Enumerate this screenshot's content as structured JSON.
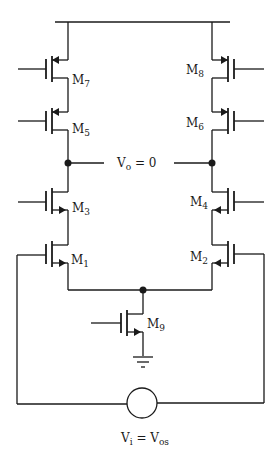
{
  "diagram": {
    "type": "circuit-schematic",
    "transistors": [
      {
        "name": "M",
        "sub": "7",
        "type": "PMOS",
        "side": "left"
      },
      {
        "name": "M",
        "sub": "5",
        "type": "PMOS",
        "side": "left"
      },
      {
        "name": "M",
        "sub": "3",
        "type": "NMOS",
        "side": "left"
      },
      {
        "name": "M",
        "sub": "1",
        "type": "NMOS",
        "side": "left"
      },
      {
        "name": "M",
        "sub": "8",
        "type": "PMOS",
        "side": "right"
      },
      {
        "name": "M",
        "sub": "6",
        "type": "PMOS",
        "side": "right"
      },
      {
        "name": "M",
        "sub": "4",
        "type": "NMOS",
        "side": "right"
      },
      {
        "name": "M",
        "sub": "2",
        "type": "NMOS",
        "side": "right"
      },
      {
        "name": "M",
        "sub": "9",
        "type": "NMOS",
        "side": "tail"
      }
    ],
    "output_label": {
      "main": "V",
      "sub": "o",
      "rest": " = 0"
    },
    "source_label": {
      "main": "V",
      "sub": "i",
      "mid": " = V",
      "sub2": "os"
    },
    "colors": {
      "stroke": "#1a1a1a",
      "background": "#ffffff"
    }
  }
}
